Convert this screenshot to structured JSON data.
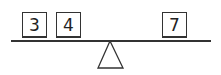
{
  "diagram": {
    "type": "balance-scale",
    "left_weights": [
      {
        "label": "3"
      },
      {
        "label": "4"
      }
    ],
    "right_weights": [
      {
        "label": "7"
      }
    ]
  }
}
